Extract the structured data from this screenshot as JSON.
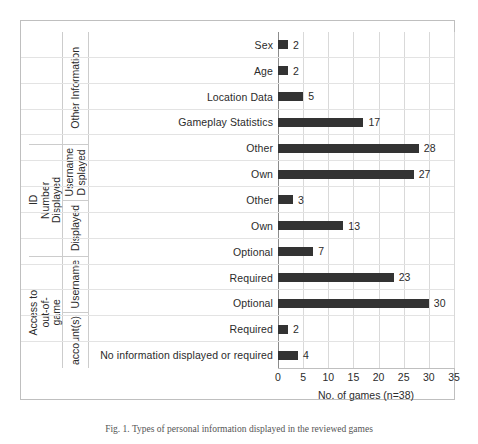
{
  "figure": {
    "caption": "Fig. 1. Types of personal information displayed in the reviewed games"
  },
  "chart_data": {
    "type": "bar",
    "orientation": "horizontal",
    "title": "",
    "xlabel": "No. of games (n=38)",
    "ylabel": "",
    "xlim": [
      0,
      35
    ],
    "xticks": [
      0,
      5,
      10,
      15,
      20,
      25,
      30,
      35
    ],
    "grid": true,
    "legend": false,
    "bar_color": "#333333",
    "categories": [
      "Sex",
      "Age",
      "Location Data",
      "Gameplay Statistics",
      "Other",
      "Own",
      "Other",
      "Own",
      "Optional",
      "Required",
      "Optional",
      "Required",
      "No information displayed or required"
    ],
    "values": [
      2,
      2,
      5,
      17,
      28,
      27,
      3,
      13,
      7,
      23,
      30,
      2,
      4
    ],
    "group_labels": {
      "level1": [
        "Other Information",
        "ID\nNumber\nDisplayed",
        "Access to\nout-of-\ngame"
      ],
      "level2": [
        "Username\nDisplayed",
        "account(s)",
        "Username"
      ]
    },
    "hierarchy": [
      {
        "outer": "Other Information",
        "inner": "",
        "items": [
          {
            "label": "Sex",
            "value": 2
          },
          {
            "label": "Age",
            "value": 2
          },
          {
            "label": "Location Data",
            "value": 5
          },
          {
            "label": "Gameplay Statistics",
            "value": 17
          }
        ]
      },
      {
        "outer": "",
        "inner": "Username Displayed",
        "items": [
          {
            "label": "Other",
            "value": 28
          },
          {
            "label": "Own",
            "value": 27
          }
        ]
      },
      {
        "outer": "ID Number",
        "inner": "Displayed",
        "items": [
          {
            "label": "Other",
            "value": 3
          },
          {
            "label": "Own",
            "value": 13
          }
        ]
      },
      {
        "outer": "",
        "inner": "Username",
        "items": [
          {
            "label": "Optional",
            "value": 7
          },
          {
            "label": "Required",
            "value": 23
          }
        ]
      },
      {
        "outer": "Access to out-of-game",
        "inner": "account(s)",
        "items": [
          {
            "label": "Optional",
            "value": 30
          },
          {
            "label": "Required",
            "value": 2
          }
        ]
      },
      {
        "outer": "",
        "inner": "",
        "items": [
          {
            "label": "No information displayed or required",
            "value": 4
          }
        ]
      }
    ]
  },
  "axis": {
    "tick_0": "0",
    "tick_1": "5",
    "tick_2": "10",
    "tick_3": "15",
    "tick_4": "20",
    "tick_5": "25",
    "tick_6": "30",
    "tick_7": "35",
    "x_title": "No. of games (n=38)"
  },
  "labels": {
    "other_information": "Other Information",
    "username_displayed": "Username\nDisplayed",
    "id": "ID",
    "number": "Number",
    "displayed": "Displayed",
    "access_to": "Access to",
    "out_of": "out-of-",
    "game": "game",
    "accounts": "account(s)",
    "username": "Username"
  }
}
